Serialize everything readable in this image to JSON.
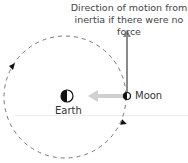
{
  "diagram": {
    "caption_line1": "Direction of motion from",
    "caption_line2": "inertia if there were no force",
    "moon_label": "Moon",
    "earth_label": "Earth",
    "colors": {
      "orbit": "#777777",
      "inertia_arrow": "#8a8a8a",
      "gravity_arrow": "#d0d0d0",
      "baseline": "#eeeeee",
      "text": "#333333"
    }
  }
}
